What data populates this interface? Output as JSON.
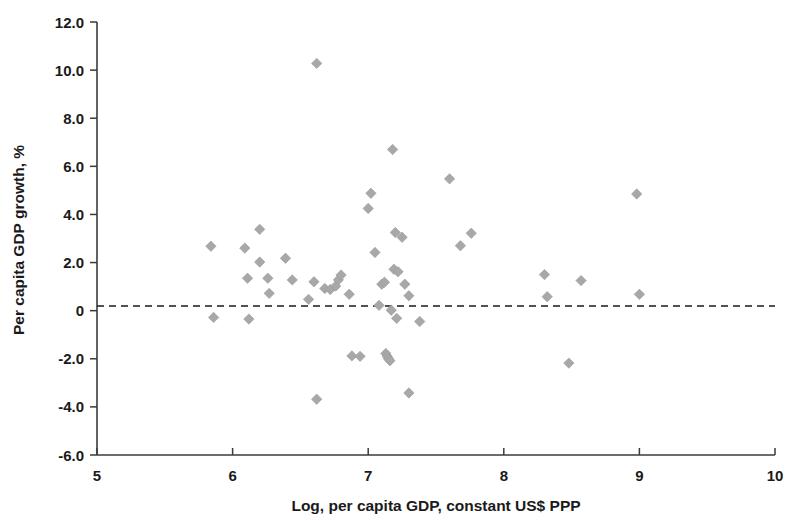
{
  "chart_data": {
    "type": "scatter",
    "title": "",
    "xlabel": "Log, per capita GDP, constant US$ PPP",
    "ylabel": "Per capita GDP growth, %",
    "xlim": [
      5,
      10
    ],
    "ylim": [
      -6.0,
      12.0
    ],
    "xticks": [
      5,
      6,
      7,
      8,
      9,
      10
    ],
    "xtick_labels": [
      "5",
      "6",
      "7",
      "8",
      "9",
      "10"
    ],
    "yticks": [
      -6.0,
      -4.0,
      -2.0,
      0,
      2.0,
      4.0,
      6.0,
      8.0,
      10.0,
      12.0
    ],
    "ytick_labels": [
      "-6.0",
      "-4.0",
      "-2.0",
      "0",
      "2.0",
      "4.0",
      "6.0",
      "8.0",
      "10.0",
      "12.0"
    ],
    "grid": false,
    "legend": null,
    "marker_shape": "diamond",
    "marker_color": "#a8a8a8",
    "reference_lines": [
      {
        "name": "zero-line",
        "axis": "y",
        "value": 0,
        "style": "dashed",
        "color": "#1a1a1a"
      }
    ],
    "points": [
      {
        "x": 5.84,
        "y": 2.68
      },
      {
        "x": 5.86,
        "y": -0.28
      },
      {
        "x": 6.09,
        "y": 2.6
      },
      {
        "x": 6.11,
        "y": 1.35
      },
      {
        "x": 6.12,
        "y": -0.35
      },
      {
        "x": 6.2,
        "y": 3.38
      },
      {
        "x": 6.2,
        "y": 2.02
      },
      {
        "x": 6.26,
        "y": 1.35
      },
      {
        "x": 6.27,
        "y": 0.72
      },
      {
        "x": 6.39,
        "y": 2.18
      },
      {
        "x": 6.44,
        "y": 1.28
      },
      {
        "x": 6.56,
        "y": 0.47
      },
      {
        "x": 6.6,
        "y": 1.2
      },
      {
        "x": 6.62,
        "y": 10.28
      },
      {
        "x": 6.62,
        "y": -3.68
      },
      {
        "x": 6.68,
        "y": 0.92
      },
      {
        "x": 6.72,
        "y": 0.88
      },
      {
        "x": 6.76,
        "y": 1.02
      },
      {
        "x": 6.78,
        "y": 1.28
      },
      {
        "x": 6.8,
        "y": 1.48
      },
      {
        "x": 6.86,
        "y": 0.68
      },
      {
        "x": 6.88,
        "y": -1.88
      },
      {
        "x": 6.94,
        "y": -1.9
      },
      {
        "x": 7.0,
        "y": 4.25
      },
      {
        "x": 7.02,
        "y": 4.88
      },
      {
        "x": 7.05,
        "y": 2.42
      },
      {
        "x": 7.08,
        "y": 0.22
      },
      {
        "x": 7.1,
        "y": 1.1
      },
      {
        "x": 7.12,
        "y": 1.18
      },
      {
        "x": 7.13,
        "y": -1.78
      },
      {
        "x": 7.14,
        "y": -1.9
      },
      {
        "x": 7.15,
        "y": -2.0
      },
      {
        "x": 7.16,
        "y": -2.08
      },
      {
        "x": 7.17,
        "y": 0.02
      },
      {
        "x": 7.18,
        "y": 6.7
      },
      {
        "x": 7.19,
        "y": 1.72
      },
      {
        "x": 7.2,
        "y": 3.25
      },
      {
        "x": 7.21,
        "y": -0.32
      },
      {
        "x": 7.22,
        "y": 1.62
      },
      {
        "x": 7.25,
        "y": 3.05
      },
      {
        "x": 7.27,
        "y": 1.1
      },
      {
        "x": 7.3,
        "y": 0.62
      },
      {
        "x": 7.3,
        "y": -3.42
      },
      {
        "x": 7.38,
        "y": -0.45
      },
      {
        "x": 7.6,
        "y": 5.48
      },
      {
        "x": 7.68,
        "y": 2.7
      },
      {
        "x": 7.76,
        "y": 3.22
      },
      {
        "x": 8.3,
        "y": 1.5
      },
      {
        "x": 8.32,
        "y": 0.58
      },
      {
        "x": 8.48,
        "y": -2.18
      },
      {
        "x": 8.57,
        "y": 1.25
      },
      {
        "x": 8.98,
        "y": 4.85
      },
      {
        "x": 9.0,
        "y": 0.68
      }
    ]
  }
}
